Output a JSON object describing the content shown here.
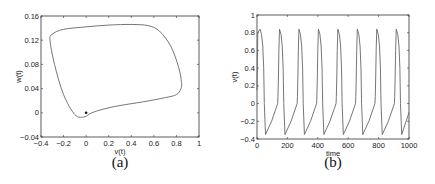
{
  "chart_data": [
    {
      "id": "a",
      "type": "line",
      "caption": "(a)",
      "title": "",
      "xlabel": "v(t)",
      "ylabel": "w(t)",
      "xlim": [
        -0.4,
        1
      ],
      "ylim": [
        -0.04,
        0.16
      ],
      "xticks": [
        "-0.4",
        "-0.2",
        "0",
        "0.2",
        "0.4",
        "0.6",
        "0.8",
        "1"
      ],
      "yticks": [
        "-0.04",
        "0",
        "0.04",
        "0.08",
        "0.12",
        "0.16"
      ],
      "grid": false,
      "series": [
        {
          "name": "limit cycle",
          "x": [
            -0.32,
            -0.3,
            -0.2,
            0.0,
            0.2,
            0.4,
            0.55,
            0.65,
            0.75,
            0.82,
            0.845,
            0.84,
            0.8,
            0.7,
            0.5,
            0.3,
            0.15,
            0.05,
            -0.02,
            -0.1,
            -0.2,
            -0.28,
            -0.32
          ],
          "y": [
            0.12,
            0.13,
            0.138,
            0.142,
            0.145,
            0.146,
            0.144,
            0.135,
            0.11,
            0.075,
            0.05,
            0.04,
            0.03,
            0.025,
            0.018,
            0.012,
            0.006,
            0.0,
            -0.007,
            -0.003,
            0.03,
            0.08,
            0.12
          ]
        },
        {
          "name": "initial point",
          "x": [
            0.0
          ],
          "y": [
            0.0
          ],
          "marker": "dot"
        }
      ]
    },
    {
      "id": "b",
      "type": "line",
      "caption": "(b)",
      "title": "",
      "xlabel": "time",
      "ylabel": "v(t)",
      "xlim": [
        0,
        1000
      ],
      "ylim": [
        -0.4,
        1
      ],
      "xticks": [
        "0",
        "200",
        "400",
        "600",
        "800",
        "1000"
      ],
      "yticks": [
        "-0.4",
        "-0.2",
        "0",
        "0.2",
        "0.4",
        "0.6",
        "0.8",
        "1"
      ],
      "grid": false,
      "series": [
        {
          "name": "v(t)",
          "period": 128,
          "peak": 0.84,
          "trough": -0.35,
          "peak_times": [
            20,
            148,
            276,
            404,
            532,
            660,
            788,
            916
          ],
          "trough_times": [
            56,
            184,
            312,
            440,
            568,
            696,
            824,
            952
          ]
        }
      ]
    }
  ]
}
